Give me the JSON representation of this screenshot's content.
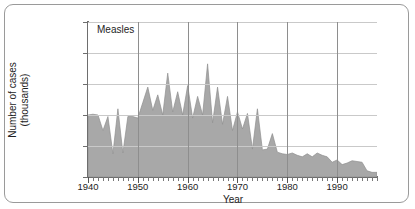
{
  "frame": {
    "style": "rounded-white-card",
    "border_color": "#9a9a9a"
  },
  "chart_data": {
    "type": "area",
    "title": "Measles",
    "xlabel": "Year",
    "ylabel": "Number of cases\n(thousands)",
    "ylabel_line1": "Number of cases",
    "ylabel_line2": "(thousands)",
    "xlim": [
      1940,
      1998
    ],
    "ylim": [
      0,
      1000
    ],
    "yticks": [
      0,
      200,
      400,
      600,
      800,
      1000
    ],
    "ytick_labels": [
      "0",
      "200",
      "400",
      "600",
      "800",
      "1000"
    ],
    "xticks": [
      1940,
      1950,
      1960,
      1970,
      1980,
      1990
    ],
    "xtick_labels": [
      "1940",
      "1950",
      "1960",
      "1970",
      "1980",
      "1990"
    ],
    "minor_xtick_interval": 1,
    "grid": {
      "horizontal": true,
      "vertical": true,
      "vertical_at": [
        1950,
        1960,
        1970,
        1980,
        1990
      ]
    },
    "legend": "none",
    "fill_color": "#a8a8a8",
    "line_color": "#8f8f8f",
    "units": "thousands of cases",
    "x": [
      1940,
      1941,
      1942,
      1943,
      1944,
      1945,
      1946,
      1947,
      1948,
      1949,
      1950,
      1951,
      1952,
      1953,
      1954,
      1955,
      1956,
      1957,
      1958,
      1959,
      1960,
      1961,
      1962,
      1963,
      1964,
      1965,
      1966,
      1967,
      1968,
      1969,
      1970,
      1971,
      1972,
      1973,
      1974,
      1975,
      1976,
      1977,
      1978,
      1979,
      1980,
      1981,
      1982,
      1983,
      1984,
      1985,
      1986,
      1987,
      1988,
      1989,
      1990,
      1991,
      1992,
      1993,
      1994,
      1995,
      1996,
      1997,
      1998
    ],
    "values": [
      400,
      405,
      400,
      300,
      390,
      150,
      440,
      155,
      390,
      390,
      380,
      480,
      580,
      430,
      530,
      400,
      670,
      420,
      550,
      400,
      590,
      380,
      520,
      400,
      730,
      350,
      580,
      340,
      520,
      300,
      420,
      310,
      410,
      180,
      440,
      175,
      180,
      280,
      160,
      150,
      145,
      155,
      140,
      130,
      150,
      130,
      155,
      140,
      130,
      95,
      110,
      80,
      90,
      105,
      100,
      95,
      40,
      30,
      30
    ]
  }
}
